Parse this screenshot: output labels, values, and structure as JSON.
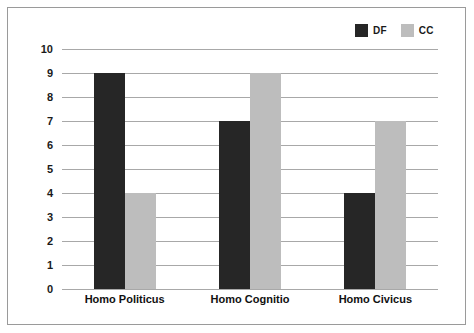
{
  "chart_data": {
    "type": "bar",
    "title": "",
    "subtitle": "",
    "xlabel": "",
    "ylabel": "",
    "categories": [
      "Homo Politicus",
      "Homo Cognitio",
      "Homo Civicus"
    ],
    "series": [
      {
        "name": "DF",
        "color": "#262626",
        "values": [
          9,
          7,
          4
        ]
      },
      {
        "name": "CC",
        "color": "#bdbdbd",
        "values": [
          4,
          9,
          7
        ]
      }
    ],
    "ylim": [
      0,
      10
    ],
    "ytick_labels": [
      "10",
      "9",
      "8",
      "7",
      "6",
      "5",
      "4",
      "3",
      "2",
      "1",
      "0"
    ],
    "ytick_values": [
      10,
      9,
      8,
      7,
      6,
      5,
      4,
      3,
      2,
      1,
      0
    ],
    "grid": true,
    "grid_color": "#a8a8a8",
    "legend_position": "top-right",
    "background": "#ffffff",
    "frame_color": "#9a9a9a"
  }
}
